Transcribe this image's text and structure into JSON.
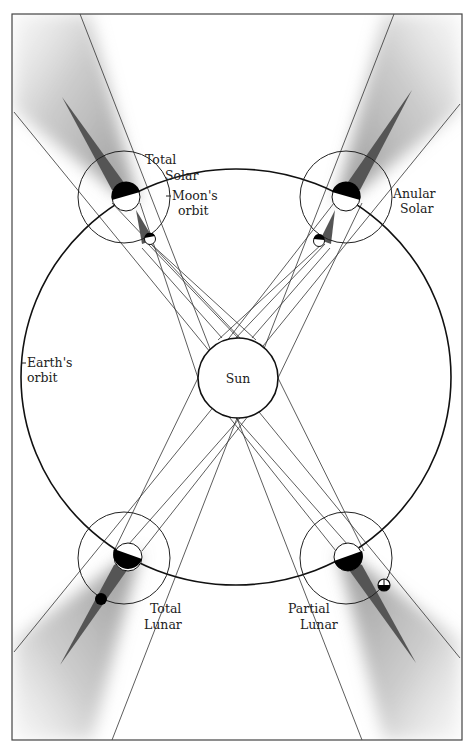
{
  "figure": {
    "labels": {
      "sun": "Sun",
      "earths_orbit_line1": "Earth's",
      "earths_orbit_line2": "orbit",
      "moons_orbit_line1": "Moon's",
      "moons_orbit_line2": "orbit",
      "total_solar_line1": "Total",
      "total_solar_line2": "Solar",
      "anular_solar_line1": "Anular",
      "anular_solar_line2": "Solar",
      "total_lunar_line1": "Total",
      "total_lunar_line2": "Lunar",
      "partial_lunar_line1": "Partial",
      "partial_lunar_line2": "Lunar"
    },
    "colors": {
      "line": "#222222",
      "umbra": "#555555",
      "penumbra": "#9a9a9a",
      "night_side": "#000000",
      "background": "#ffffff"
    },
    "positions": [
      {
        "id": "total-solar",
        "quadrant": "top-left"
      },
      {
        "id": "anular-solar",
        "quadrant": "top-right"
      },
      {
        "id": "total-lunar",
        "quadrant": "bottom-left"
      },
      {
        "id": "partial-lunar",
        "quadrant": "bottom-right"
      }
    ]
  }
}
